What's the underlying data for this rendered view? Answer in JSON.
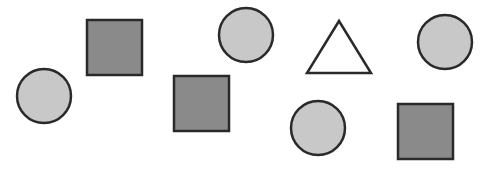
{
  "canvas": {
    "width": 486,
    "height": 169,
    "background": "#ffffff"
  },
  "colors": {
    "stroke": "#2a2a2a",
    "circle_fill": "#c8c8c8",
    "square_fill": "#8a8a8a",
    "triangle_fill": "#ffffff"
  },
  "shapes": [
    {
      "type": "circle",
      "cx": 44,
      "cy": 96,
      "r": 27
    },
    {
      "type": "square",
      "x": 87,
      "y": 20,
      "size": 55
    },
    {
      "type": "square",
      "x": 174,
      "y": 76,
      "size": 55
    },
    {
      "type": "circle",
      "cx": 246,
      "cy": 35,
      "r": 27
    },
    {
      "type": "triangle",
      "points": [
        [
          339,
          21
        ],
        [
          307,
          73
        ],
        [
          371,
          73
        ]
      ]
    },
    {
      "type": "circle",
      "cx": 445,
      "cy": 42,
      "r": 27
    },
    {
      "type": "circle",
      "cx": 318,
      "cy": 128,
      "r": 27
    },
    {
      "type": "square",
      "x": 398,
      "y": 104,
      "size": 55
    }
  ],
  "summary": {
    "circles": 4,
    "squares": 3,
    "triangles": 1,
    "total": 8
  }
}
